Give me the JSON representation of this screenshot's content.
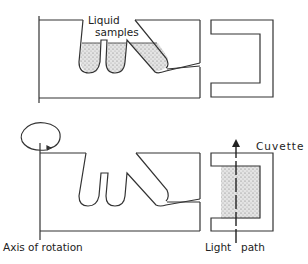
{
  "diagram": {
    "labels": {
      "liquid": "Liquid",
      "samples": "samples",
      "cuvette": "Cuvette",
      "axis_of_rotation": "Axis of rotation",
      "light": "Light",
      "path": "path"
    },
    "colors": {
      "line": "#333333",
      "fill": "#cfcfcf",
      "background": "#ffffff"
    }
  }
}
